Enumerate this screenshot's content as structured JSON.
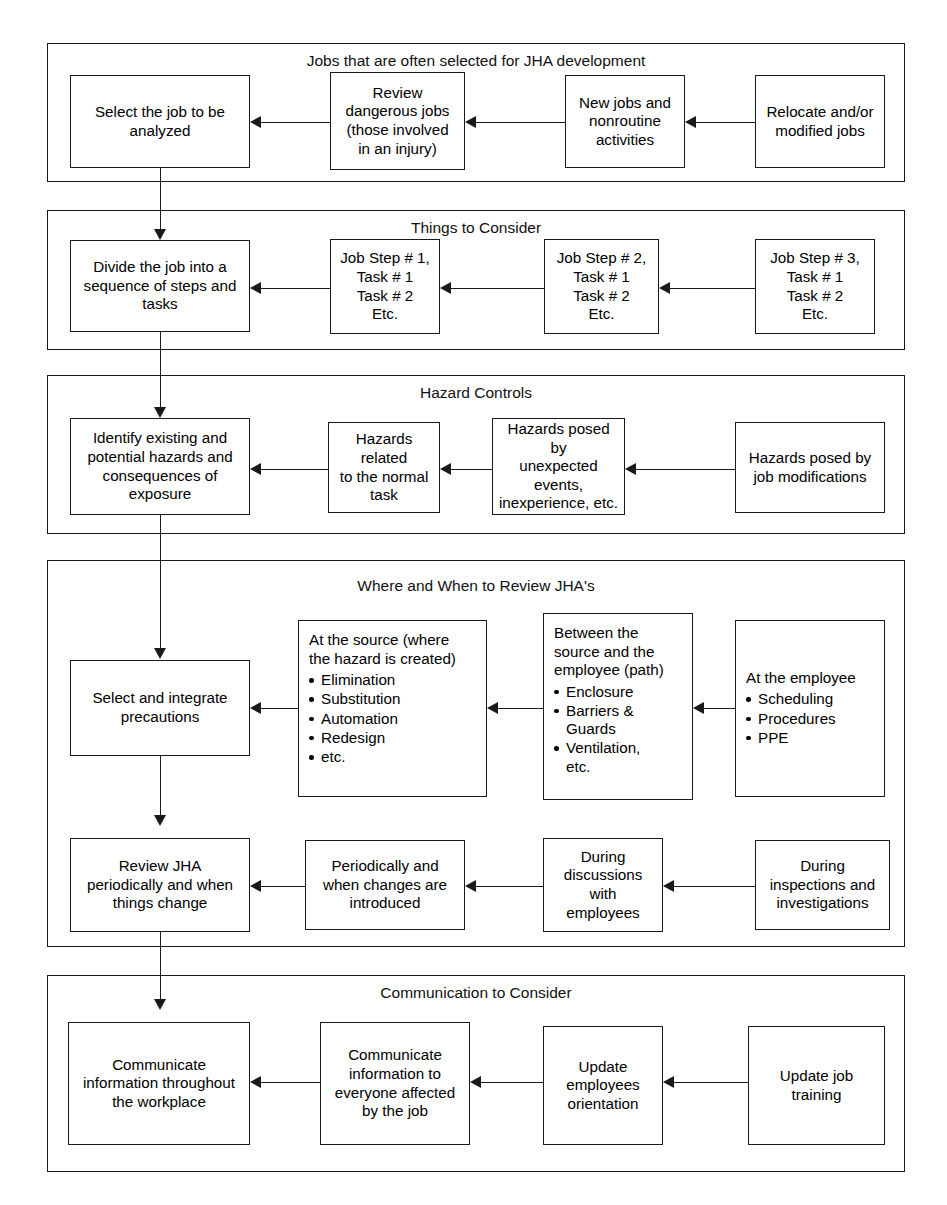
{
  "diagram": {
    "sections": [
      {
        "id": "jobs-selected",
        "heading": "Jobs that are often selected for JHA development",
        "nodes": [
          {
            "id": "select-job",
            "text": "Select the job to be\nanalyzed"
          },
          {
            "id": "review-dangerous",
            "text": "Review\ndangerous jobs\n(those involved\nin an injury)"
          },
          {
            "id": "new-jobs",
            "text": "New jobs and\nnonroutine\nactivities"
          },
          {
            "id": "relocate-modified",
            "text": "Relocate and/or\nmodified jobs"
          }
        ]
      },
      {
        "id": "things-to-consider",
        "heading": "Things to Consider",
        "nodes": [
          {
            "id": "divide-job",
            "text": "Divide the job into a\nsequence of steps and\ntasks"
          },
          {
            "id": "job-step-1",
            "text": "Job Step # 1,\nTask # 1\nTask # 2\nEtc."
          },
          {
            "id": "job-step-2",
            "text": "Job Step # 2,\nTask # 1\nTask # 2\nEtc."
          },
          {
            "id": "job-step-3",
            "text": "Job Step # 3,\nTask # 1\nTask # 2\nEtc."
          }
        ]
      },
      {
        "id": "hazard-controls",
        "heading": "Hazard Controls",
        "nodes": [
          {
            "id": "identify-hazards",
            "text": "Identify existing and\npotential hazards and\nconsequences of\nexposure"
          },
          {
            "id": "hazards-normal",
            "text": "Hazards related\nto the normal\ntask"
          },
          {
            "id": "hazards-unexpected",
            "text": "Hazards posed by\nunexpected\nevents,\ninexperience, etc."
          },
          {
            "id": "hazards-modifications",
            "text": "Hazards posed by\njob modifications"
          }
        ]
      },
      {
        "id": "where-when-review",
        "heading": "Where and When to Review JHA's",
        "nodes": [
          {
            "id": "select-precautions",
            "text": "Select and integrate\nprecautions"
          },
          {
            "id": "at-the-source",
            "head": "At the source (where\nthe hazard is created)",
            "bullets": [
              "Elimination",
              "Substitution",
              "Automation",
              "Redesign",
              "etc."
            ]
          },
          {
            "id": "between-source-employee",
            "head": "Between the\nsource and the\nemployee (path)",
            "bullets": [
              "Enclosure",
              "Barriers &\nGuards",
              "Ventilation,\netc."
            ]
          },
          {
            "id": "at-the-employee",
            "head": "At the employee",
            "bullets": [
              "Scheduling",
              "Procedures",
              "PPE"
            ]
          },
          {
            "id": "review-jha",
            "text": "Review JHA\nperiodically and when\nthings change"
          },
          {
            "id": "periodically-changes",
            "text": "Periodically and\nwhen changes are\nintroduced"
          },
          {
            "id": "during-discussions",
            "text": "During\ndiscussions\nwith\nemployees"
          },
          {
            "id": "during-inspections",
            "text": "During\ninspections and\ninvestigations"
          }
        ]
      },
      {
        "id": "communication",
        "heading": "Communication to Consider",
        "nodes": [
          {
            "id": "communicate-workplace",
            "text": "Communicate\ninformation throughout\nthe workplace"
          },
          {
            "id": "communicate-everyone",
            "text": "Communicate\ninformation to\neveryone affected\nby the job"
          },
          {
            "id": "update-orientation",
            "text": "Update\nemployees\norientation"
          },
          {
            "id": "update-training",
            "text": "Update job\ntraining"
          }
        ]
      }
    ],
    "colors": {
      "stroke": "#1a1a1a",
      "background": "#ffffff",
      "text": "#000000"
    }
  }
}
